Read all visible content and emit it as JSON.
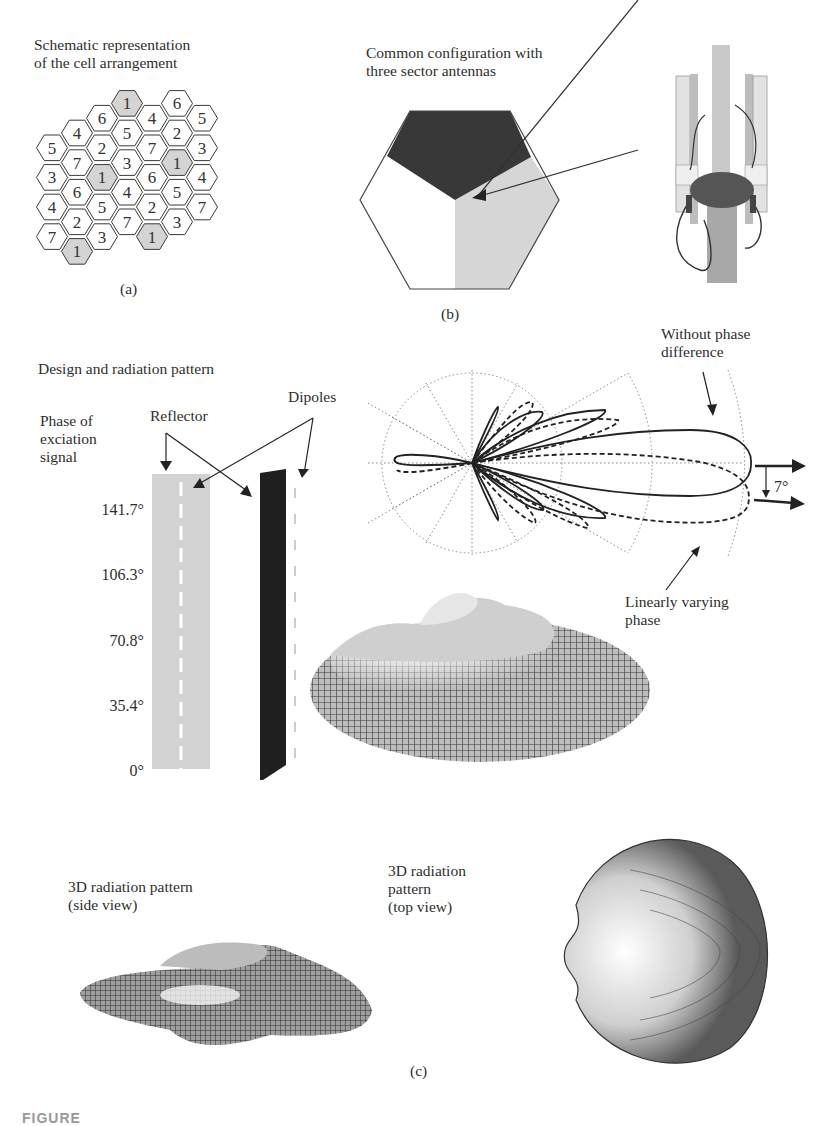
{
  "panel_a": {
    "title": "Schematic representation\nof the cell arrangement",
    "label": "(a)",
    "reuse_factor": 7,
    "highlight_color": "#d4d4d4",
    "cells": [
      {
        "col": 0,
        "row": 1,
        "n": "5"
      },
      {
        "col": 0,
        "row": 3,
        "n": "3"
      },
      {
        "col": 0,
        "row": 5,
        "n": "4"
      },
      {
        "col": 0,
        "row": 7,
        "n": "7"
      },
      {
        "col": 1,
        "row": 0,
        "n": "4"
      },
      {
        "col": 1,
        "row": 2,
        "n": "7"
      },
      {
        "col": 1,
        "row": 4,
        "n": "6"
      },
      {
        "col": 1,
        "row": 6,
        "n": "2"
      },
      {
        "col": 1,
        "row": 8,
        "n": "1"
      },
      {
        "col": 2,
        "row": -1,
        "n": "6"
      },
      {
        "col": 2,
        "row": 1,
        "n": "2"
      },
      {
        "col": 2,
        "row": 3,
        "n": "1"
      },
      {
        "col": 2,
        "row": 5,
        "n": "5"
      },
      {
        "col": 2,
        "row": 7,
        "n": "3"
      },
      {
        "col": 3,
        "row": -2,
        "n": "1"
      },
      {
        "col": 3,
        "row": 0,
        "n": "5"
      },
      {
        "col": 3,
        "row": 2,
        "n": "3"
      },
      {
        "col": 3,
        "row": 4,
        "n": "4"
      },
      {
        "col": 3,
        "row": 6,
        "n": "7"
      },
      {
        "col": 4,
        "row": -1,
        "n": "4"
      },
      {
        "col": 4,
        "row": 1,
        "n": "7"
      },
      {
        "col": 4,
        "row": 3,
        "n": "6"
      },
      {
        "col": 4,
        "row": 5,
        "n": "2"
      },
      {
        "col": 4,
        "row": 7,
        "n": "1"
      },
      {
        "col": 5,
        "row": -2,
        "n": "6"
      },
      {
        "col": 5,
        "row": 0,
        "n": "2"
      },
      {
        "col": 5,
        "row": 2,
        "n": "1"
      },
      {
        "col": 5,
        "row": 4,
        "n": "5"
      },
      {
        "col": 5,
        "row": 6,
        "n": "3"
      },
      {
        "col": 6,
        "row": -1,
        "n": "5"
      },
      {
        "col": 6,
        "row": 1,
        "n": "3"
      },
      {
        "col": 6,
        "row": 3,
        "n": "4"
      },
      {
        "col": 6,
        "row": 5,
        "n": "7"
      }
    ]
  },
  "panel_b": {
    "title": "Common configuration with\nthree sector antennas",
    "label": "(b)",
    "sector_colors": [
      "#3a3a3a",
      "#ffffff",
      "#d6d6d6"
    ],
    "photo_alt": "three-sector antenna mast photo"
  },
  "panel_c": {
    "section_title": "Design and radiation pattern",
    "phase_label": "Phase of\nexciation\nsignal",
    "reflector_label": "Reflector",
    "dipoles_label": "Dipoles",
    "phases": [
      "141.7°",
      "106.3°",
      "70.8°",
      "35.4°",
      "0°"
    ],
    "without_phase_label": "Without phase\ndifference",
    "linear_phase_label": "Linearly varying\nphase",
    "tilt_label": "7°",
    "side_view_label": "3D radiation pattern\n(side view)",
    "top_view_label": "3D radiation\npattern\n(top view)",
    "label": "(c)"
  },
  "chart_data": {
    "type": "polar",
    "title": "Design and radiation pattern",
    "series": [
      {
        "name": "Without phase difference",
        "style": "solid",
        "main_lobe_direction_deg": 0
      },
      {
        "name": "Linearly varying phase",
        "style": "dashed",
        "main_lobe_direction_deg": -7
      }
    ],
    "annotations": [
      "7°"
    ],
    "grid": {
      "rings": 3,
      "spokes_deg": 30
    }
  },
  "caption": "FIGURE"
}
